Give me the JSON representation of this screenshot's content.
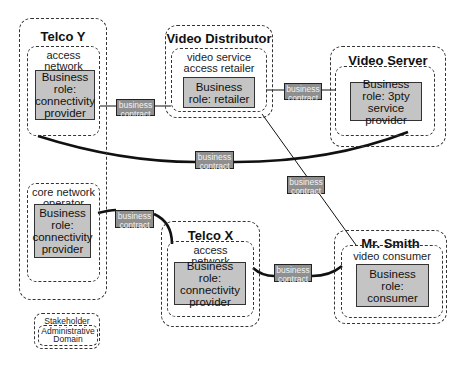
{
  "diagram": {
    "domains": {
      "telco_y": {
        "title": "Telco Y",
        "groups": [
          {
            "label": "access network operator",
            "role": "Business role: connectivity provider"
          },
          {
            "label": "core network operator",
            "role": "Business role: connectivity provider"
          }
        ]
      },
      "video_distributor": {
        "title": "Video Distributor",
        "group": {
          "label": "video service access retailer",
          "role": "Business role: retailer"
        }
      },
      "video_server": {
        "title": "Video Server",
        "group": {
          "label": "",
          "role": "Business role: 3pty service provider"
        }
      },
      "telco_x": {
        "title": "Telco X",
        "group": {
          "label": "access network operator",
          "role": "Business role: connectivity provider"
        }
      },
      "mr_smith": {
        "title": "Mr. Smith",
        "group": {
          "label": "video consumer",
          "role": "Business role: consumer"
        }
      }
    },
    "contracts": [
      {
        "id": "telcoY-access_to_distributor",
        "label_line1": "business",
        "label_line2": "contract"
      },
      {
        "id": "distributor_to_server",
        "label_line1": "business",
        "label_line2": "contract"
      },
      {
        "id": "telcoY-access_to_server",
        "label_line1": "business",
        "label_line2": "contract"
      },
      {
        "id": "distributor_to_smith",
        "label_line1": "business",
        "label_line2": "contract"
      },
      {
        "id": "telcoY-core_to_telcoX",
        "label_line1": "business",
        "label_line2": "contract"
      },
      {
        "id": "telcoX_to_smith",
        "label_line1": "business",
        "label_line2": "contract"
      }
    ],
    "legend": {
      "line1": "Stakeholder",
      "line2": "Administrative",
      "line3": "Domain"
    },
    "colors": {
      "role_fill": "#c4c4c4",
      "contract_fill": "#8f8f8f",
      "line": "#111111"
    }
  }
}
